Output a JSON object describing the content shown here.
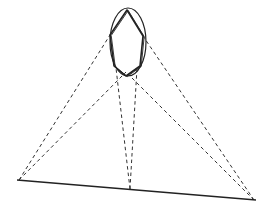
{
  "diagram": {
    "description": "Line drawing of an ellipse containing an inscribed hexagon, suspended above a slanted baseline, with dashed projection lines connecting three points on the baseline to vertices of the hexagon.",
    "colors": {
      "background": "#ffffff",
      "stroke": "#222222",
      "dashed": "#333333"
    },
    "ellipse": {
      "cx": 128,
      "cy": 42,
      "rx": 18,
      "ry": 34
    },
    "hexagon": [
      [
        127,
        10
      ],
      [
        143,
        36
      ],
      [
        140,
        66
      ],
      [
        126,
        76
      ],
      [
        114,
        66
      ],
      [
        110,
        35
      ]
    ],
    "baseline": {
      "x1": 17,
      "y1": 180,
      "x2": 256,
      "y2": 200
    },
    "projection_points": {
      "left": [
        19,
        180
      ],
      "middle": [
        130,
        189
      ],
      "right": [
        254,
        200
      ]
    },
    "dashed_lines": [
      {
        "from": [
          19,
          180
        ],
        "to": [
          110,
          35
        ]
      },
      {
        "from": [
          19,
          180
        ],
        "to": [
          126,
          72
        ]
      },
      {
        "from": [
          130,
          189
        ],
        "to": [
          116,
          68
        ]
      },
      {
        "from": [
          130,
          189
        ],
        "to": [
          137,
          68
        ]
      },
      {
        "from": [
          254,
          200
        ],
        "to": [
          143,
          36
        ]
      },
      {
        "from": [
          254,
          200
        ],
        "to": [
          128,
          74
        ]
      }
    ]
  }
}
